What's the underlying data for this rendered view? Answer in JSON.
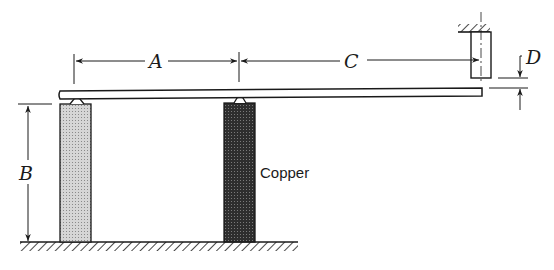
{
  "diagram": {
    "type": "mechanical-schematic",
    "labels": {
      "A": "A",
      "B": "B",
      "C": "C",
      "D": "D",
      "copper": "Copper"
    },
    "colors": {
      "line": "#1a1a1a",
      "left_post_fill": "#c8c8c8",
      "copper_post_fill": "#3a3a3a",
      "background": "#ffffff"
    },
    "components": [
      {
        "name": "left-post",
        "material": "unlabeled (light)"
      },
      {
        "name": "copper-post",
        "material": "Copper"
      },
      {
        "name": "beam",
        "description": "horizontal bar resting on knife-edge supports"
      },
      {
        "name": "stop",
        "description": "fixed pin hanging from ceiling above beam tip"
      },
      {
        "name": "ground",
        "description": "hatched base"
      },
      {
        "name": "ceiling",
        "description": "hatched support"
      }
    ],
    "dimensions": [
      {
        "label": "A",
        "description": "distance between supports"
      },
      {
        "label": "B",
        "description": "post height"
      },
      {
        "label": "C",
        "description": "distance from copper support to stop"
      },
      {
        "label": "D",
        "description": "gap between beam and stop"
      }
    ]
  }
}
